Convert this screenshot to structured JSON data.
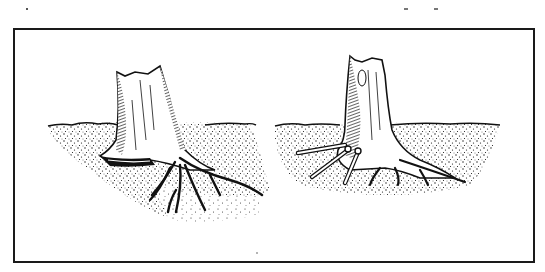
{
  "figure": {
    "panels": [
      {
        "id": "left",
        "subject": "tree stump with saw cut at base and spreading exposed roots"
      },
      {
        "id": "right",
        "subject": "tree stump with three rods/drill bits inserted near base and spreading roots"
      }
    ],
    "colors": {
      "ink": "#111111",
      "paper": "#ffffff",
      "frame": "#1a1a1a"
    }
  }
}
